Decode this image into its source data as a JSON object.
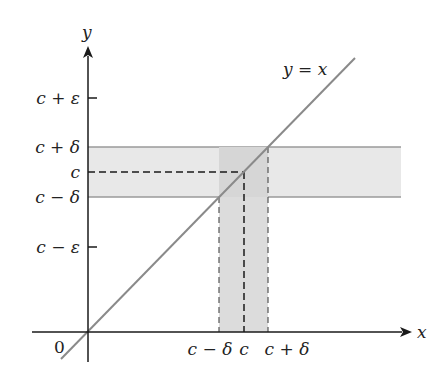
{
  "diagram": {
    "title": "",
    "axes": {
      "x_label": "x",
      "y_label": "y",
      "origin_label": "0"
    },
    "line": {
      "label": "y = x",
      "color": "#8a8a8a"
    },
    "y_ticks": [
      {
        "label": "c + ε",
        "y": 98
      },
      {
        "label": "c + δ",
        "y": 147
      },
      {
        "label": "c",
        "y": 172
      },
      {
        "label": "c − δ",
        "y": 197
      },
      {
        "label": "c − ε",
        "y": 247
      }
    ],
    "x_ticks": [
      {
        "label": "c − δ",
        "x": 219
      },
      {
        "label": "c",
        "x": 244
      },
      {
        "label": "c + δ",
        "x": 268
      }
    ],
    "colors": {
      "axis": "#1a1a1a",
      "band_fill": "#e6e6e6",
      "overlap_fill": "#d2d2d2",
      "band_edge": "#9a9a9a",
      "dash": "#1a1a1a"
    }
  }
}
